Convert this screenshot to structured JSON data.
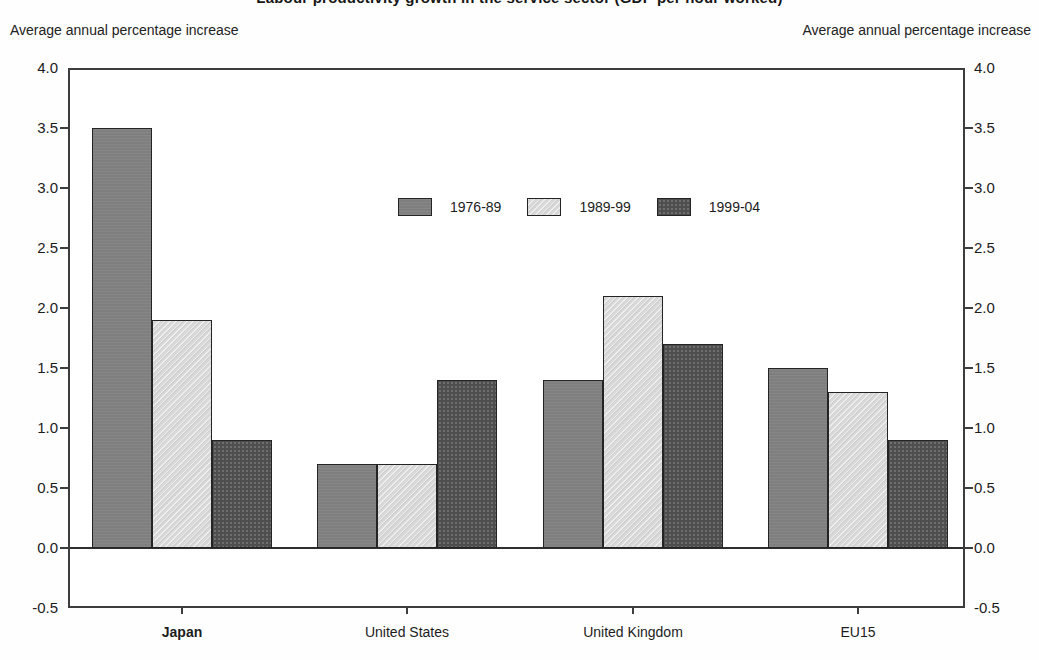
{
  "title": "Labour productivity growth in the service sector (GDP per hour worked)",
  "title_note": "cropped at top edge of screenshot",
  "left_axis_caption": "Average annual percentage increase",
  "right_axis_caption": "Average annual percentage increase",
  "chart_data": {
    "type": "bar",
    "categories": [
      "Japan",
      "United States",
      "United Kingdom",
      "EU15"
    ],
    "bold_category": "Japan",
    "series": [
      {
        "name": "1976-89",
        "color": "#7f7f7f",
        "texture": "noise-mid",
        "values": [
          3.5,
          0.7,
          1.4,
          1.5
        ]
      },
      {
        "name": "1989-99",
        "color": "#d9d9d9",
        "texture": "hatch-light",
        "values": [
          1.9,
          0.7,
          2.1,
          1.3
        ]
      },
      {
        "name": "1999-04",
        "color": "#4e4e4e",
        "texture": "dots-dark",
        "values": [
          0.9,
          1.4,
          1.7,
          0.9
        ]
      }
    ],
    "ylabel": "Average annual percentage increase",
    "ylim": [
      -0.5,
      4.0
    ],
    "ytick_step": 0.5,
    "ytick_labels": [
      "4.0",
      "3.5",
      "3.0",
      "2.5",
      "2.0",
      "1.5",
      "1.0",
      "0.5",
      "0.0",
      "-0.5"
    ],
    "yticks_on_both_sides": true,
    "grid": false,
    "legend_position": "inside-top-center",
    "frame_color": "#3d3d3d",
    "bar_border_color": "#242424",
    "background_color": "#ffffff"
  }
}
